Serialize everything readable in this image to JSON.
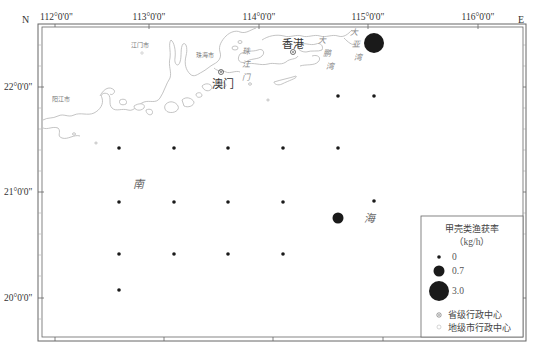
{
  "map": {
    "corner_labels": {
      "north": "N",
      "east": "E"
    },
    "lon_ticks": [
      {
        "label": "112°0'0\"",
        "x": 40
      },
      {
        "label": "113°0'0\"",
        "x": 149
      },
      {
        "label": "114°0'0\"",
        "x": 259
      },
      {
        "label": "115°0'0\"",
        "x": 368
      },
      {
        "label": "116°0'0\"",
        "x": 478
      }
    ],
    "lat_ticks": [
      {
        "label": "22°0'0\"",
        "y": 87
      },
      {
        "label": "21°0'0\"",
        "y": 192
      },
      {
        "label": "20°0'0\"",
        "y": 298
      }
    ],
    "place_labels": {
      "jiangmen": "江门市",
      "zhuhai": "珠海市",
      "yangjiang": "阳江市",
      "macau": "澳门",
      "hongkong": "香港",
      "pearl_river_mouth": [
        "珠",
        "江",
        "门"
      ],
      "dapeng_bay": [
        "大",
        "鹏",
        "湾"
      ],
      "daya_bay": [
        "大",
        "亚",
        "湾"
      ],
      "south_sea": [
        "南",
        "海"
      ]
    },
    "stations": [
      {
        "x": 338,
        "y": 96,
        "value": "0"
      },
      {
        "x": 374,
        "y": 96,
        "value": "0"
      },
      {
        "x": 119,
        "y": 148,
        "value": "0"
      },
      {
        "x": 174,
        "y": 148,
        "value": "0"
      },
      {
        "x": 228,
        "y": 148,
        "value": "0"
      },
      {
        "x": 283,
        "y": 148,
        "value": "0"
      },
      {
        "x": 338,
        "y": 148,
        "value": "0"
      },
      {
        "x": 119,
        "y": 202,
        "value": "0"
      },
      {
        "x": 174,
        "y": 202,
        "value": "0"
      },
      {
        "x": 228,
        "y": 202,
        "value": "0"
      },
      {
        "x": 283,
        "y": 202,
        "value": "0"
      },
      {
        "x": 374,
        "y": 201,
        "value": "0"
      },
      {
        "x": 338,
        "y": 218,
        "value": "0.7"
      },
      {
        "x": 374,
        "y": 43,
        "value": "3.0"
      },
      {
        "x": 119,
        "y": 254,
        "value": "0"
      },
      {
        "x": 174,
        "y": 254,
        "value": "0"
      },
      {
        "x": 228,
        "y": 254,
        "value": "0"
      },
      {
        "x": 283,
        "y": 254,
        "value": "0"
      },
      {
        "x": 119,
        "y": 290,
        "value": "0"
      }
    ]
  },
  "legend": {
    "title": "甲壳类渔获率",
    "unit": "（kg/h）",
    "sizes": [
      {
        "label": "0",
        "radius": 1.8
      },
      {
        "label": "0.7",
        "radius": 5.5
      },
      {
        "label": "3.0",
        "radius": 10
      }
    ],
    "provincial_center": "省级行政中心",
    "prefecture_center": "地级市行政中心"
  },
  "colors": {
    "frame": "#555555",
    "coast": "#b5b5b5",
    "station": "#1a1a1a"
  }
}
